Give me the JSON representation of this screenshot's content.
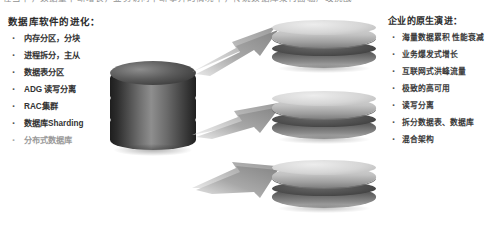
{
  "slide": {
    "top_partial_line": "在当下，数据量不断增长，业务访问不断攀升的情况下，传统数据库架构面临严峻挑战",
    "background_color": "#ffffff"
  },
  "left_column": {
    "heading": "数据库软件的进化：",
    "items": [
      {
        "label": "内存分区，分块",
        "faded": false
      },
      {
        "label": "进程拆分，主从",
        "faded": false
      },
      {
        "label": "数据表分区",
        "faded": false
      },
      {
        "label": "ADG 读写分离",
        "faded": false
      },
      {
        "label": "RAC集群",
        "faded": false
      },
      {
        "label": "数据库Sharding",
        "faded": false
      },
      {
        "label": "分布式数据库",
        "faded": true
      }
    ]
  },
  "right_column": {
    "heading": "企业的原生演进：",
    "items": [
      {
        "label": "海量数据累积 性能衰减"
      },
      {
        "label": "业务爆发式增长"
      },
      {
        "label": "互联网式洪峰流量"
      },
      {
        "label": "极致的高可用"
      },
      {
        "label": "读写分离"
      },
      {
        "label": "拆分数据表、数据库"
      },
      {
        "label": "混合架构"
      }
    ]
  },
  "diagram": {
    "source_label": "数据库",
    "source_segments": 3,
    "targets": [
      {
        "name": "shard-1",
        "discs": 2
      },
      {
        "name": "shard-2",
        "discs": 2
      },
      {
        "name": "shard-3",
        "discs": 2
      }
    ],
    "arrows": [
      {
        "name": "arrow-to-shard-1"
      },
      {
        "name": "arrow-to-shard-2"
      },
      {
        "name": "arrow-to-shard-3"
      }
    ],
    "colors": {
      "cylinder_dark": "#2b2b2b",
      "cylinder_mid": "#8e8e8e",
      "disc_light": "#c9c9c9",
      "disc_dark": "#4f4f4f",
      "arrow_fill": "#9c9c9c"
    }
  }
}
